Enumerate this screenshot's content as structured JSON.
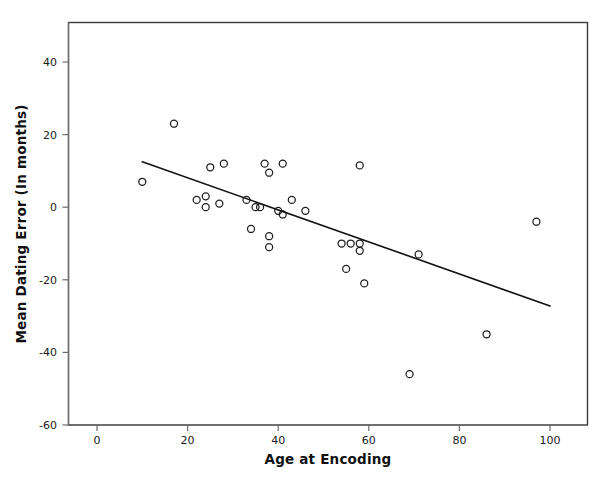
{
  "chart_data": {
    "type": "scatter",
    "title": "",
    "xlabel": "Age at Encoding",
    "ylabel": "Mean Dating Error (In months)",
    "xlim": [
      -7,
      107
    ],
    "ylim": [
      -60,
      50
    ],
    "xticks": [
      0,
      20,
      40,
      60,
      80,
      100
    ],
    "yticks": [
      -60,
      -40,
      -20,
      0,
      20,
      40
    ],
    "xtick_labels": [
      "0",
      "20",
      "40",
      "60",
      "80",
      "100"
    ],
    "ytick_labels": [
      "-60",
      "-40",
      "-20",
      "0",
      "20",
      "40"
    ],
    "grid": false,
    "legend": "none",
    "marker": "open-circle",
    "marker_color": "#1d1d1d",
    "points": [
      {
        "x": 10,
        "y": 7
      },
      {
        "x": 17,
        "y": 23
      },
      {
        "x": 22,
        "y": 2
      },
      {
        "x": 25,
        "y": 11
      },
      {
        "x": 24,
        "y": 3
      },
      {
        "x": 24,
        "y": 0
      },
      {
        "x": 27,
        "y": 1
      },
      {
        "x": 28,
        "y": 12
      },
      {
        "x": 33,
        "y": 2
      },
      {
        "x": 34,
        "y": -6
      },
      {
        "x": 35,
        "y": 0
      },
      {
        "x": 36,
        "y": 0
      },
      {
        "x": 37,
        "y": 12
      },
      {
        "x": 38,
        "y": 9.5
      },
      {
        "x": 38,
        "y": -8
      },
      {
        "x": 38,
        "y": -11
      },
      {
        "x": 40,
        "y": -1
      },
      {
        "x": 41,
        "y": 12
      },
      {
        "x": 41,
        "y": -2
      },
      {
        "x": 43,
        "y": 2
      },
      {
        "x": 46,
        "y": -1
      },
      {
        "x": 54,
        "y": -10
      },
      {
        "x": 56,
        "y": -10
      },
      {
        "x": 58,
        "y": -10
      },
      {
        "x": 55,
        "y": -17
      },
      {
        "x": 58,
        "y": -12
      },
      {
        "x": 58,
        "y": 11.5
      },
      {
        "x": 59,
        "y": -21
      },
      {
        "x": 69,
        "y": -46
      },
      {
        "x": 71,
        "y": -13
      },
      {
        "x": 86,
        "y": -35
      },
      {
        "x": 97,
        "y": -4
      }
    ],
    "trendline": {
      "type": "linear-fit",
      "x_start": 10,
      "y_start": 12.5,
      "x_end": 100,
      "y_end": -27.2,
      "color": "#111111"
    }
  }
}
